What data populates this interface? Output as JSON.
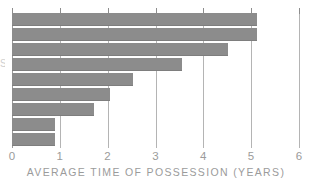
{
  "chart_data": {
    "type": "bar",
    "orientation": "horizontal",
    "title": "",
    "subtitle": "",
    "xlabel": "AVERAGE TIME OF POSSESSION (YEARS)",
    "ylabel": "",
    "xlim": [
      0,
      6
    ],
    "xticks": [
      0,
      1,
      2,
      3,
      4,
      5,
      6
    ],
    "xtick_labels": [
      "0",
      "1",
      "2",
      "3",
      "4",
      "5",
      "6"
    ],
    "grid": true,
    "grid_axis": "x",
    "legend": false,
    "legend_position": "none",
    "categories": [
      "",
      "",
      "",
      "",
      "",
      "",
      "",
      "",
      ""
    ],
    "ytick_labels": [],
    "values": [
      5.12,
      5.12,
      4.52,
      3.55,
      2.53,
      2.05,
      1.72,
      0.9,
      0.9
    ],
    "bar_color": "#8c8c8c",
    "grid_color": "#b4b4b4",
    "text_color": "#9b9b9b",
    "background": "#ffffff",
    "annotations": [],
    "partial_y_axis_mark": "S"
  },
  "axis": {
    "x_title": "AVERAGE TIME OF POSSESSION (YEARS)"
  }
}
